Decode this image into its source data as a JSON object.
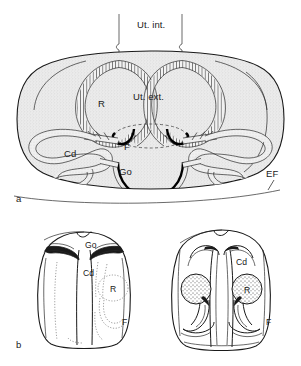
{
  "figure": {
    "background_color": "#ffffff",
    "ink_color": "#1a1a1a",
    "body_fill_color": "#e8e8e8",
    "panels": [
      {
        "marker": "a",
        "view": "transverse section, dorsal aspect",
        "labels": [
          {
            "key": "ut_int",
            "text": "Ut. int.",
            "meaning": "uterus internus"
          },
          {
            "key": "ut_ext",
            "text": "Ut. ext.",
            "meaning": "uterus externus"
          },
          {
            "key": "r_left",
            "text": "R",
            "meaning": "receptaculum"
          },
          {
            "key": "f",
            "text": "F",
            "meaning": "fertilization duct"
          },
          {
            "key": "cd",
            "text": "Cd",
            "meaning": "ductus"
          },
          {
            "key": "go",
            "text": "Go",
            "meaning": "gonopore"
          },
          {
            "key": "ef",
            "text": "EF",
            "meaning": "epigynal fold"
          }
        ]
      },
      {
        "marker": "b",
        "view": "paired ventral views",
        "left_figure": {
          "labels": [
            {
              "key": "go",
              "text": "Go"
            },
            {
              "key": "cd",
              "text": "Cd"
            },
            {
              "key": "r",
              "text": "R"
            },
            {
              "key": "f",
              "text": "F"
            }
          ]
        },
        "right_figure": {
          "labels": [
            {
              "key": "cd",
              "text": "Cd"
            },
            {
              "key": "r",
              "text": "R"
            },
            {
              "key": "f",
              "text": "F"
            }
          ]
        }
      }
    ]
  },
  "labels": {
    "ut_int": "Ut. int.",
    "ut_ext": "Ut. ext.",
    "r": "R",
    "f": "F",
    "cd": "Cd",
    "go": "Go",
    "ef": "EF",
    "panel_a": "a",
    "panel_b": "b",
    "b_left_go": "Go",
    "b_left_cd": "Cd",
    "b_left_r": "R",
    "b_left_f": "F",
    "b_right_cd": "Cd",
    "b_right_r": "R",
    "b_right_f": "F"
  }
}
